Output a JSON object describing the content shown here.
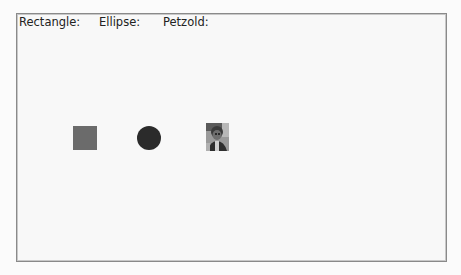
{
  "labels": {
    "rectangle": "Rectangle:",
    "ellipse": "Ellipse:",
    "petzold": "Petzold:"
  },
  "shapes": {
    "rectangle": {
      "fill": "#6b6b6b"
    },
    "ellipse": {
      "fill": "#2b2b2b"
    },
    "petzold": {
      "icon": "portrait-photo"
    }
  },
  "colors": {
    "background": "#fbfbfb",
    "border": "#8a8a8a",
    "text": "#222222"
  }
}
